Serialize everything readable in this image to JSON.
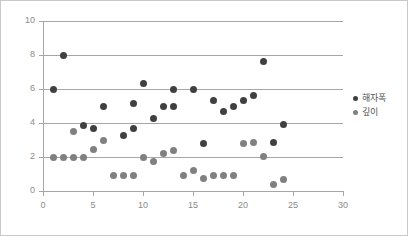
{
  "chart_data": {
    "type": "scatter",
    "title": "",
    "xlabel": "",
    "ylabel": "",
    "xlim": [
      0,
      30
    ],
    "ylim": [
      0,
      10
    ],
    "xticks": [
      0,
      5,
      10,
      15,
      20,
      25,
      30
    ],
    "yticks": [
      0,
      2,
      4,
      6,
      8,
      10
    ],
    "grid": "horizontal",
    "legend_position": "right",
    "series": [
      {
        "name": "해자폭",
        "color": "#404040",
        "points": [
          [
            1,
            6.0
          ],
          [
            2,
            8.0
          ],
          [
            4,
            3.85
          ],
          [
            5,
            3.7
          ],
          [
            6,
            5.0
          ],
          [
            8,
            3.25
          ],
          [
            9,
            3.7
          ],
          [
            9,
            5.15
          ],
          [
            10,
            6.35
          ],
          [
            11,
            4.25
          ],
          [
            12,
            5.0
          ],
          [
            13,
            5.95
          ],
          [
            13,
            4.95
          ],
          [
            15,
            5.95
          ],
          [
            16,
            2.8
          ],
          [
            17,
            5.35
          ],
          [
            18,
            4.65
          ],
          [
            19,
            4.95
          ],
          [
            20,
            5.3
          ],
          [
            21,
            5.6
          ],
          [
            22,
            7.6
          ],
          [
            23,
            2.85
          ],
          [
            24,
            3.9
          ]
        ]
      },
      {
        "name": "깊이",
        "color": "#808080",
        "points": [
          [
            1,
            2.0
          ],
          [
            2,
            2.0
          ],
          [
            3,
            2.0
          ],
          [
            3,
            3.5
          ],
          [
            4,
            1.95
          ],
          [
            5,
            2.45
          ],
          [
            6,
            3.0
          ],
          [
            7,
            0.9
          ],
          [
            8,
            0.9
          ],
          [
            9,
            0.9
          ],
          [
            10,
            1.95
          ],
          [
            11,
            1.75
          ],
          [
            12,
            2.2
          ],
          [
            13,
            2.4
          ],
          [
            14,
            0.9
          ],
          [
            15,
            1.2
          ],
          [
            16,
            0.75
          ],
          [
            17,
            0.9
          ],
          [
            18,
            0.9
          ],
          [
            19,
            0.9
          ],
          [
            20,
            2.8
          ],
          [
            21,
            2.85
          ],
          [
            22,
            2.05
          ],
          [
            23,
            0.4
          ],
          [
            24,
            0.65
          ]
        ]
      }
    ]
  },
  "axes": {
    "y_tick_labels": [
      "0",
      "2",
      "4",
      "6",
      "8",
      "10"
    ],
    "x_tick_labels": [
      "0",
      "5",
      "10",
      "15",
      "20",
      "25",
      "30"
    ]
  },
  "legend": {
    "items": [
      {
        "label": "해자폭",
        "color": "#404040"
      },
      {
        "label": "깊이",
        "color": "#808080"
      }
    ]
  }
}
